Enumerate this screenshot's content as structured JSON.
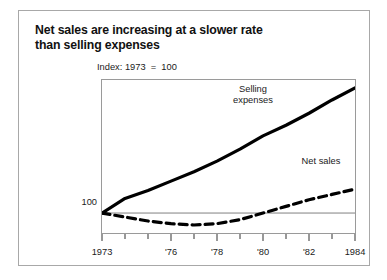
{
  "figure": {
    "title_lines": [
      "Net sales are increasing at a slower rate",
      "than selling expenses"
    ],
    "index_note": "Index: 1973  =  100",
    "y_reference_label": "100"
  },
  "chart_data": {
    "type": "line",
    "title": "Net sales are increasing at a slower rate than selling expenses",
    "subtitle": "Index: 1973  =  100",
    "xlabel": "",
    "ylabel": "",
    "x": [
      1973,
      1974,
      1975,
      1976,
      1977,
      1978,
      1979,
      1980,
      1981,
      1982,
      1983,
      1984
    ],
    "xlim": [
      1973,
      1984
    ],
    "ylim": [
      85,
      200
    ],
    "x_tick_values": [
      1973,
      1974,
      1975,
      1976,
      1977,
      1978,
      1979,
      1980,
      1981,
      1982,
      1983,
      1984
    ],
    "x_tick_labels": [
      "1973",
      "",
      "",
      "'76",
      "",
      "'78",
      "",
      "'80",
      "",
      "'82",
      "",
      "1984"
    ],
    "y_tick_values": [
      100
    ],
    "y_tick_labels": [
      "100"
    ],
    "reference_line": {
      "y": 100,
      "style": "solid",
      "color": "#808080"
    },
    "grid": false,
    "legend": "inline-annotations",
    "series": [
      {
        "name": "Selling expenses",
        "style": "solid",
        "color": "#000000",
        "label_position": "upper-center",
        "values": [
          100,
          111,
          117,
          124,
          131,
          139,
          148,
          158,
          166,
          175,
          185,
          194
        ]
      },
      {
        "name": "Net sales",
        "style": "dashed",
        "color": "#000000",
        "label_position": "right-middle",
        "values": [
          100,
          97,
          94,
          92,
          91,
          92,
          95,
          100,
          105,
          110,
          114,
          118
        ]
      }
    ],
    "annotations": [
      {
        "text": "Selling\nexpenses",
        "series": "Selling expenses"
      },
      {
        "text": "Net sales",
        "series": "Net sales"
      }
    ]
  },
  "colors": {
    "card_border": "#a8a8a8",
    "plot_border": "#9a9a9a",
    "line": "#000000",
    "reference_line": "#808080",
    "text": "#1a1a1a",
    "background": "#ffffff"
  }
}
